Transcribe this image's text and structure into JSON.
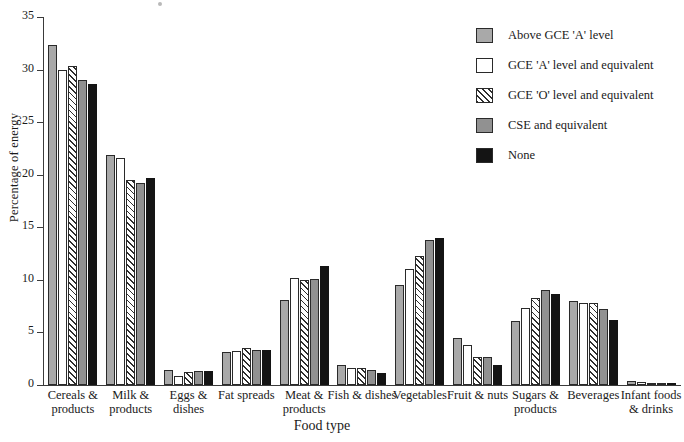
{
  "chart_data": {
    "type": "bar",
    "title": "",
    "xlabel": "Food type",
    "ylabel": "Percentage of energy",
    "ylim": [
      0,
      35
    ],
    "yticks": [
      0,
      5,
      10,
      15,
      20,
      25,
      30,
      35
    ],
    "grid": false,
    "legend_position": "right",
    "categories": [
      "Cereals &\nproducts",
      "Milk &\nproducts",
      "Eggs &\ndishes",
      "Fat spreads",
      "Meat &\nproducts",
      "Fish & dishes",
      "Vegetables",
      "Fruit & nuts",
      "Sugars &\nproducts",
      "Beverages",
      "Infant foods\n& drinks"
    ],
    "series": [
      {
        "name": "Above GCE 'A' level",
        "color": "#a9a9a9",
        "fill": "solid-light-grey",
        "values": [
          32.3,
          21.9,
          1.4,
          3.1,
          8.1,
          1.9,
          9.5,
          4.5,
          6.1,
          8.0,
          0.4
        ]
      },
      {
        "name": "GCE 'A' level and equivalent",
        "color": "#ffffff",
        "fill": "white",
        "values": [
          30.0,
          21.6,
          0.9,
          3.2,
          10.2,
          1.6,
          11.0,
          3.8,
          7.3,
          7.8,
          0.3
        ]
      },
      {
        "name": "GCE 'O' level and equivalent",
        "color": "#ffffff",
        "fill": "diagonal-hatch",
        "values": [
          30.3,
          19.5,
          1.2,
          3.5,
          10.0,
          1.6,
          12.3,
          2.7,
          8.3,
          7.8,
          0.15
        ]
      },
      {
        "name": "CSE and equivalent",
        "color": "#919191",
        "fill": "solid-mid-grey",
        "values": [
          29.0,
          19.2,
          1.3,
          3.3,
          10.1,
          1.4,
          13.8,
          2.7,
          9.0,
          7.2,
          0.12
        ]
      },
      {
        "name": "None",
        "color": "#141414",
        "fill": "solid-black",
        "values": [
          28.6,
          19.7,
          1.3,
          3.3,
          11.3,
          1.1,
          14.0,
          1.9,
          8.7,
          6.2,
          0.08
        ]
      }
    ]
  },
  "axes": {
    "y_title": "Percentage of energy",
    "x_title": "Food type",
    "y_tick_labels": [
      "0",
      "5",
      "10",
      "15",
      "20",
      "25",
      "30",
      "35"
    ]
  },
  "legend": {
    "items": [
      {
        "label": "Above GCE 'A' level"
      },
      {
        "label": "GCE 'A' level and equivalent"
      },
      {
        "label": "GCE 'O' level and equivalent"
      },
      {
        "label": "CSE and equivalent"
      },
      {
        "label": "None"
      }
    ]
  }
}
